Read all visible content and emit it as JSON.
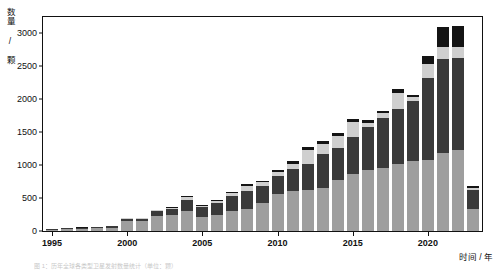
{
  "chart_data": {
    "type": "bar",
    "stacked": true,
    "title": "",
    "xlabel": "时间 / 年",
    "ylabel": "数量 / 颗",
    "grid": false,
    "legend": "none",
    "ylim": [
      0,
      3250
    ],
    "yticks": [
      0,
      500,
      1000,
      1500,
      2000,
      2500,
      3000
    ],
    "ytick_labels": [
      "0",
      "500",
      "1000",
      "1500",
      "2000",
      "2500",
      "3000"
    ],
    "xlim": [
      1994.4,
      2023.6
    ],
    "xticks": [
      1995,
      2000,
      2005,
      2010,
      2015,
      2020
    ],
    "xtick_labels": [
      "1995",
      "2000",
      "2005",
      "2010",
      "2015",
      "2020"
    ],
    "categories": [
      1995,
      1996,
      1997,
      1998,
      1999,
      2000,
      2001,
      2002,
      2003,
      2004,
      2005,
      2006,
      2007,
      2008,
      2009,
      2010,
      2011,
      2012,
      2013,
      2014,
      2015,
      2016,
      2017,
      2018,
      2019,
      2020,
      2021,
      2022,
      2023
    ],
    "series": [
      {
        "name": "series-1",
        "color": "#9e9e9e",
        "values": [
          20,
          28,
          34,
          40,
          48,
          150,
          150,
          235,
          250,
          300,
          210,
          250,
          300,
          330,
          430,
          560,
          610,
          620,
          650,
          780,
          870,
          930,
          960,
          1020,
          1070,
          1080,
          1190,
          1230,
          330
        ]
      },
      {
        "name": "series-2",
        "color": "#3a3a3a",
        "values": [
          14,
          14,
          16,
          18,
          22,
          40,
          40,
          70,
          90,
          170,
          150,
          180,
          230,
          280,
          250,
          280,
          330,
          400,
          520,
          480,
          560,
          650,
          760,
          840,
          900,
          1250,
          1430,
          1400,
          300
        ]
      },
      {
        "name": "series-3",
        "color": "#cfcfcf",
        "values": [
          2,
          2,
          3,
          3,
          4,
          8,
          8,
          12,
          14,
          40,
          22,
          30,
          40,
          80,
          60,
          60,
          80,
          210,
          150,
          190,
          220,
          60,
          70,
          230,
          60,
          210,
          180,
          170,
          20
        ]
      },
      {
        "name": "series-4",
        "color": "#141414",
        "values": [
          2,
          2,
          2,
          2,
          2,
          4,
          4,
          6,
          8,
          20,
          10,
          14,
          20,
          30,
          26,
          30,
          40,
          50,
          40,
          46,
          50,
          40,
          40,
          60,
          40,
          120,
          300,
          320,
          40
        ]
      }
    ]
  },
  "caption": {
    "text": "图 1：历年全球各类型卫星发射数量统计（单位：颗）"
  }
}
